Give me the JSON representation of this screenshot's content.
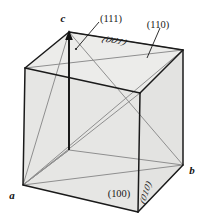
{
  "figure": {
    "background_color": "#ffffff",
    "face_fill_color": "#e8e8e6",
    "edge_color": "#1a1a1a",
    "diagonal_color": "#8a8a8a",
    "arrow_color": "#111111"
  },
  "axis_labels": {
    "a": "a",
    "b": "b",
    "c": "c"
  },
  "plane_labels": {
    "p111": "(111)",
    "p110": "(110)",
    "p001": "(001)",
    "p100": "(100)",
    "p010": "(010)"
  },
  "geometry": {
    "vertices": {
      "front_bottom_left": [
        23,
        185
      ],
      "front_bottom_right": [
        138,
        212
      ],
      "front_top_left": [
        25,
        68
      ],
      "front_top_right": [
        140,
        93
      ],
      "back_bottom_left": [
        69,
        150
      ],
      "back_bottom_right": [
        183,
        165
      ],
      "back_top_left": [
        69,
        32
      ],
      "back_top_right": [
        183,
        50
      ]
    },
    "note": "Oblique projection cube; a = front-bottom-left, b = back-bottom-right, c = back-top-left"
  }
}
